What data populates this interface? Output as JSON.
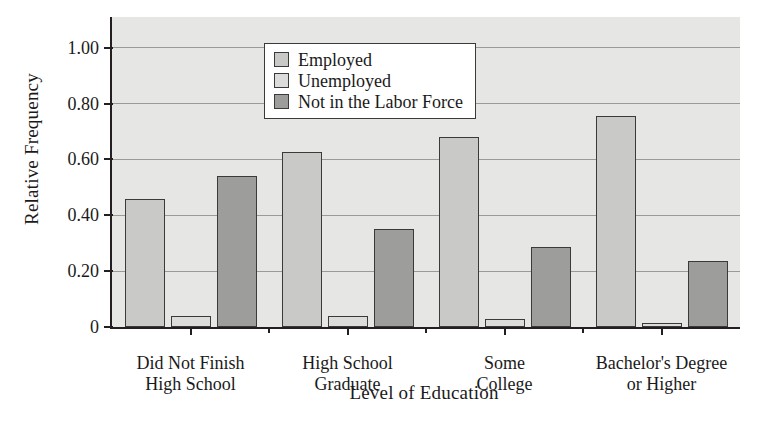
{
  "chart_data": {
    "type": "bar",
    "title": "",
    "xlabel": "Level of Education",
    "ylabel": "Relative Frequency",
    "categories": [
      "Did Not Finish\nHigh School",
      "High School\nGraduate",
      "Some\nCollege",
      "Bachelor's Degree\nor Higher"
    ],
    "category_lines": [
      [
        "Did Not Finish",
        "High School"
      ],
      [
        "High School",
        "Graduate"
      ],
      [
        "Some",
        "College"
      ],
      [
        "Bachelor's Degree",
        "or Higher"
      ]
    ],
    "series": [
      {
        "name": "Employed",
        "values": [
          0.46,
          0.625,
          0.68,
          0.755
        ],
        "color": "#c9c9c7"
      },
      {
        "name": "Unemployed",
        "values": [
          0.04,
          0.04,
          0.03,
          0.015
        ],
        "color": "#dcdcda"
      },
      {
        "name": "Not in the Labor Force",
        "values": [
          0.54,
          0.35,
          0.285,
          0.235
        ],
        "color": "#9d9d9b"
      }
    ],
    "ylim": [
      0,
      1.11
    ],
    "yticks": [
      0,
      0.2,
      0.4,
      0.6,
      0.8,
      1.0
    ],
    "ytick_labels": [
      "0",
      "0.20",
      "0.40",
      "0.60",
      "0.80",
      "1.00"
    ],
    "grid": true,
    "grid_axis": "y",
    "legend_position": "upper left",
    "plot_background": "#e6e6e4",
    "axis_color": "#231f20",
    "gridline_color": "#9a9a98"
  }
}
